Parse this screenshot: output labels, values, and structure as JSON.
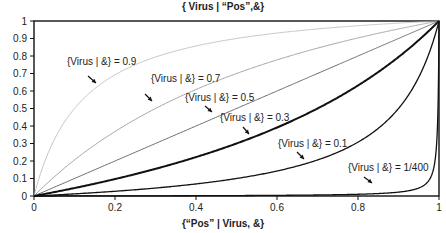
{
  "chart_data": {
    "type": "line",
    "title": "{ Virus | “Pos”,&}",
    "xlabel": "{“Pos” | Virus, &}",
    "ylabel": "",
    "xlim": [
      0,
      1
    ],
    "ylim": [
      0,
      1
    ],
    "grid": false,
    "legend": "none (inline annotations with arrows)",
    "x_ticks": [
      "0",
      "0.2",
      "0.4",
      "0.6",
      "0.8",
      "1"
    ],
    "y_ticks": [
      "0",
      "0.1",
      "0.2",
      "0.3",
      "0.4",
      "0.5",
      "0.6",
      "0.7",
      "0.8",
      "0.9",
      "1"
    ],
    "formula": "y = p*x / (p*x + (1-p)*(1-x))",
    "x": [
      0,
      0.1,
      0.2,
      0.3,
      0.4,
      0.5,
      0.6,
      0.7,
      0.8,
      0.9,
      0.95,
      0.99,
      1
    ],
    "series": [
      {
        "name": "{Virus | &} = 0.9",
        "prior": 0.9,
        "color": "#b8b8b8",
        "width": 0.8,
        "values": [
          0,
          0.5,
          0.69,
          0.79,
          0.86,
          0.9,
          0.93,
          0.95,
          0.97,
          0.99,
          0.99,
          1.0,
          1
        ]
      },
      {
        "name": "{Virus | &} = 0.7",
        "prior": 0.7,
        "color": "#9a9a9a",
        "width": 0.9,
        "values": [
          0,
          0.21,
          0.37,
          0.5,
          0.61,
          0.7,
          0.78,
          0.84,
          0.9,
          0.95,
          0.98,
          1.0,
          1
        ]
      },
      {
        "name": "{Virus | &} = 0.5",
        "prior": 0.5,
        "color": "#6a6a6a",
        "width": 1.0,
        "values": [
          0,
          0.1,
          0.2,
          0.3,
          0.4,
          0.5,
          0.6,
          0.7,
          0.8,
          0.9,
          0.95,
          0.99,
          1
        ]
      },
      {
        "name": "{Virus | &} = 0.3",
        "prior": 0.3,
        "color": "#111111",
        "width": 2.0,
        "values": [
          0,
          0.05,
          0.1,
          0.16,
          0.22,
          0.3,
          0.39,
          0.5,
          0.63,
          0.79,
          0.89,
          0.98,
          1
        ]
      },
      {
        "name": "{Virus | &} = 0.1",
        "prior": 0.1,
        "color": "#111111",
        "width": 1.3,
        "values": [
          0,
          0.01,
          0.03,
          0.05,
          0.07,
          0.1,
          0.14,
          0.21,
          0.31,
          0.5,
          0.68,
          0.92,
          1
        ]
      },
      {
        "name": "{Virus | &} = 1/400",
        "prior": 0.0025,
        "color": "#111111",
        "width": 1.3,
        "values": [
          0,
          0.0003,
          0.0006,
          0.001,
          0.0017,
          0.0025,
          0.004,
          0.006,
          0.01,
          0.02,
          0.05,
          0.2,
          1
        ]
      }
    ],
    "annotations": [
      {
        "text": "{Virus | &} = 0.9",
        "x": 0.09,
        "y": 0.8
      },
      {
        "text": "{Virus | &} = 0.7",
        "x": 0.26,
        "y": 0.7
      },
      {
        "text": "{Virus | &} = 0.5",
        "x": 0.37,
        "y": 0.6
      },
      {
        "text": "{Virus | &} = 0.3",
        "x": 0.45,
        "y": 0.5
      },
      {
        "text": "{Virus | &} = 0.1",
        "x": 0.6,
        "y": 0.3
      },
      {
        "text": "{Virus | &} = 1/400",
        "x": 0.78,
        "y": 0.12
      }
    ]
  },
  "labels": {
    "title": "{ Virus | “Pos”,&}",
    "xlabel": "{“Pos” | Virus, &}"
  }
}
